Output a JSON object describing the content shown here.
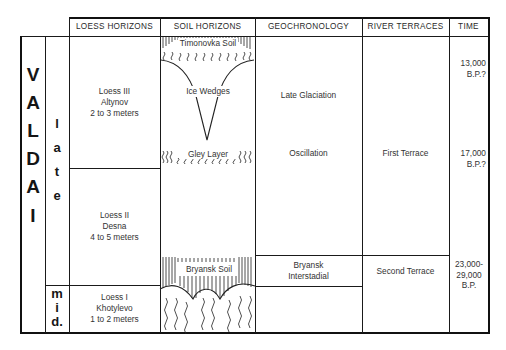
{
  "headers": {
    "loess": "LOESS HORIZONS",
    "soil": "SOIL HORIZONS",
    "geochronology": "GEOCHRONOLOGY",
    "river_terraces": "RIVER TERRACES",
    "time": "TIME"
  },
  "stage": {
    "letters": [
      "V",
      "A",
      "L",
      "D",
      "A",
      "I"
    ],
    "late_letters": [
      "l",
      "a",
      "t",
      "e"
    ],
    "mid_letters": [
      "m",
      "i",
      "d."
    ]
  },
  "loess": [
    {
      "name": "Loess III",
      "site": "Altynov",
      "thickness": "2 to 3 meters"
    },
    {
      "name": "Loess II",
      "site": "Desna",
      "thickness": "4 to 5 meters"
    },
    {
      "name": "Loess I",
      "site": "Khotylevo",
      "thickness": "1 to 2 meters"
    }
  ],
  "soil": {
    "timonovka": "Timonovka Soil",
    "ice_wedges": "Ice Wedges",
    "gley": "Gley Layer",
    "bryansk": "Bryansk Soil"
  },
  "geochronology": {
    "late_glaciation": "Late Glaciation",
    "oscillation": "Oscillation",
    "bryansk_1": "Bryansk",
    "bryansk_2": "Interstadial"
  },
  "river_terraces": {
    "first": "First Terrace",
    "second": "Second Terrace"
  },
  "time": {
    "t1_a": "13,000",
    "t1_b": "B.P.?",
    "t2_a": "17,000",
    "t2_b": "B.P.?",
    "t3_a": "23,000-",
    "t3_b": "29,000",
    "t3_c": "B.P."
  }
}
